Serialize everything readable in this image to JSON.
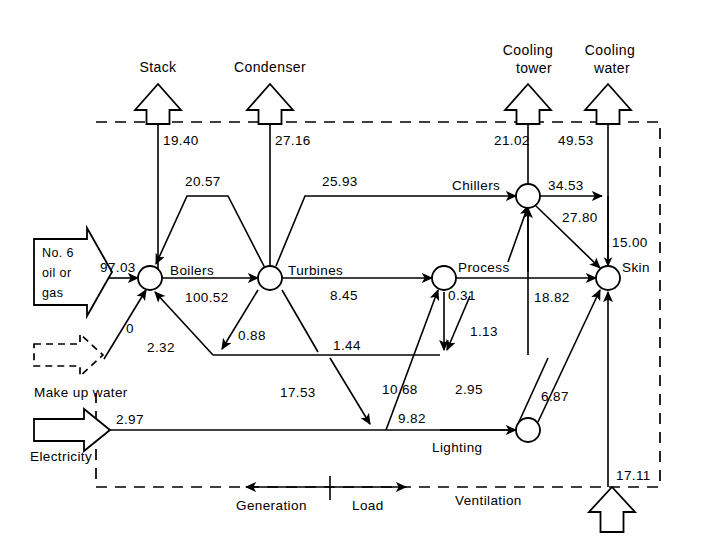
{
  "diagram": {
    "boundary_style": "dashed",
    "legend": {
      "generation_label": "Generation",
      "load_label": "Load"
    },
    "sources": [
      {
        "id": "fuel",
        "label": "No.6\noil or\ngas",
        "line1": "No. 6",
        "line2": "oil or",
        "line3": "gas",
        "value": "97.03"
      },
      {
        "id": "makeup",
        "label": "Make up water",
        "value": ""
      },
      {
        "id": "electricity",
        "label": "Electricity",
        "value": "2.97"
      },
      {
        "id": "ventilation",
        "label": "Ventilation",
        "value": "17.11"
      }
    ],
    "sinks": [
      {
        "id": "stack",
        "line1": "Stack",
        "line2": "",
        "value": "19.40"
      },
      {
        "id": "condenser",
        "line1": "Condenser",
        "line2": "",
        "value": "27.16"
      },
      {
        "id": "cooling_tower",
        "line1": "Cooling",
        "line2": "tower",
        "value": "21.02"
      },
      {
        "id": "cooling_water",
        "line1": "Cooling",
        "line2": "water",
        "value": "49.53"
      }
    ],
    "nodes": [
      {
        "id": "boilers",
        "label": "Boilers"
      },
      {
        "id": "turbines",
        "label": "Turbines"
      },
      {
        "id": "process",
        "label": "Process"
      },
      {
        "id": "chillers",
        "label": "Chillers"
      },
      {
        "id": "skin",
        "label": "Skin"
      },
      {
        "id": "lighting",
        "label": "Lighting"
      }
    ],
    "flows": [
      {
        "id": "fuel-to-boilers",
        "value": "97.03",
        "from": "fuel",
        "to": "boilers"
      },
      {
        "id": "boilers-to-turbines",
        "value": "100.52",
        "from": "boilers",
        "to": "turbines"
      },
      {
        "id": "turbines-to-boilers",
        "value": "20.57",
        "from": "turbines",
        "to": "boilers"
      },
      {
        "id": "makeup-to-boilers",
        "value": "0",
        "from": "makeup",
        "to": "boilers"
      },
      {
        "id": "return-to-boilers",
        "value": "2.32",
        "from": "return-main",
        "to": "boilers"
      },
      {
        "id": "turbines-to-return",
        "value": "0.88",
        "from": "turbines",
        "to": "return-main"
      },
      {
        "id": "turbines-to-chillers",
        "value": "25.93",
        "from": "turbines",
        "to": "chillers"
      },
      {
        "id": "turbines-to-process",
        "value": "8.45",
        "from": "turbines",
        "to": "process"
      },
      {
        "id": "turbines-to-lower",
        "value": "1.44",
        "from": "turbines",
        "to": "lower-main"
      },
      {
        "id": "process-down",
        "value": "0.31",
        "from": "process",
        "to": "lower-main"
      },
      {
        "id": "process-down-2",
        "value": "1.13",
        "from": "process",
        "to": "lower-main"
      },
      {
        "id": "lower-to-process",
        "value": "10.68",
        "from": "lower-main",
        "to": "process"
      },
      {
        "id": "lower-to-elec",
        "value": "17.53",
        "from": "lower-main",
        "to": "elec-main"
      },
      {
        "id": "elec-to-lighting",
        "value": "9.82",
        "from": "elec-main",
        "to": "lighting"
      },
      {
        "id": "lighting-to-chillers",
        "value": "2.95",
        "from": "lighting",
        "to": "chillers"
      },
      {
        "id": "lighting-to-skin",
        "value": "6.87",
        "from": "lighting",
        "to": "skin"
      },
      {
        "id": "process-to-skin",
        "value": "18.82",
        "from": "process",
        "to": "skin"
      },
      {
        "id": "chillers-to-cw",
        "value": "34.53",
        "from": "chillers",
        "to": "cooling_water"
      },
      {
        "id": "chillers-to-skin",
        "value": "27.80",
        "from": "chillers",
        "to": "skin"
      },
      {
        "id": "cw-to-skin",
        "value": "15.00",
        "from": "cooling_water",
        "to": "skin"
      },
      {
        "id": "stack-out",
        "value": "19.40",
        "from": "boilers",
        "to": "stack"
      },
      {
        "id": "condenser-out",
        "value": "27.16",
        "from": "turbines",
        "to": "condenser"
      },
      {
        "id": "ct-out",
        "value": "21.02",
        "from": "chillers",
        "to": "cooling_tower"
      },
      {
        "id": "cw-out",
        "value": "49.53",
        "from": "chillers",
        "to": "cooling_water"
      },
      {
        "id": "vent-in",
        "value": "17.11",
        "from": "ventilation",
        "to": "skin"
      },
      {
        "id": "electricity-in",
        "value": "2.97",
        "from": "electricity",
        "to": "elec-main"
      }
    ]
  }
}
